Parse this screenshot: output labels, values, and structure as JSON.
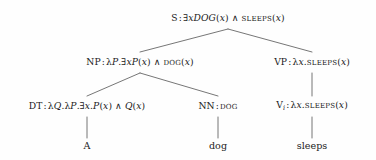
{
  "figure": {
    "kind": "syntactic-parse-tree",
    "background_color": "#fefefe",
    "text_color": "#1a1a1a",
    "edge_color": "#666666"
  },
  "nodes": {
    "s": {
      "id": "s",
      "category": "S",
      "separator": ":",
      "semantics": "∃xDOG(x) ∧ SLEEPS(x)",
      "x": 228,
      "y": 18
    },
    "np": {
      "id": "np",
      "category": "NP",
      "separator": ":",
      "semantics": "λP.∃xP(x) ∧ DOG(x)",
      "x": 140,
      "y": 62
    },
    "vp": {
      "id": "vp",
      "category": "VP",
      "separator": ":",
      "semantics": "λx.SLEEPS(x)",
      "x": 312,
      "y": 62
    },
    "dt": {
      "id": "dt",
      "category": "DT",
      "separator": ":",
      "semantics": "λQ.λP.∃x.P(x) ∧ Q(x)",
      "x": 87,
      "y": 106
    },
    "nn": {
      "id": "nn",
      "category": "NN",
      "separator": ":",
      "semantics": "DOG",
      "x": 218,
      "y": 106
    },
    "vi": {
      "id": "vi",
      "category": "V",
      "category_subscript": "i",
      "separator": ":",
      "semantics": "λx.SLEEPS(x)",
      "x": 312,
      "y": 106
    }
  },
  "leaves": {
    "det_word": {
      "text": "A",
      "x": 87,
      "y": 146
    },
    "noun_word": {
      "text": "dog",
      "x": 218,
      "y": 146
    },
    "verb_word": {
      "text": "sleeps",
      "x": 312,
      "y": 146
    }
  },
  "edges": [
    {
      "name": "s-to-np",
      "from": "s",
      "to": "np",
      "x1": 228,
      "y1": 29,
      "x2": 140,
      "y2": 52
    },
    {
      "name": "s-to-vp",
      "from": "s",
      "to": "vp",
      "x1": 228,
      "y1": 29,
      "x2": 312,
      "y2": 52
    },
    {
      "name": "np-to-dt",
      "from": "np",
      "to": "dt",
      "x1": 140,
      "y1": 73,
      "x2": 87,
      "y2": 96
    },
    {
      "name": "np-to-nn",
      "from": "np",
      "to": "nn",
      "x1": 140,
      "y1": 73,
      "x2": 218,
      "y2": 96
    },
    {
      "name": "vp-to-vi",
      "from": "vp",
      "to": "vi",
      "x1": 312,
      "y1": 73,
      "x2": 312,
      "y2": 96
    },
    {
      "name": "dt-to-word-a",
      "from": "dt",
      "to": "det_word",
      "x1": 87,
      "y1": 117,
      "x2": 87,
      "y2": 138
    },
    {
      "name": "nn-to-word-dog",
      "from": "nn",
      "to": "noun_word",
      "x1": 218,
      "y1": 117,
      "x2": 218,
      "y2": 138
    },
    {
      "name": "vi-to-word-sleeps",
      "from": "vi",
      "to": "verb_word",
      "x1": 312,
      "y1": 117,
      "x2": 312,
      "y2": 138
    }
  ]
}
